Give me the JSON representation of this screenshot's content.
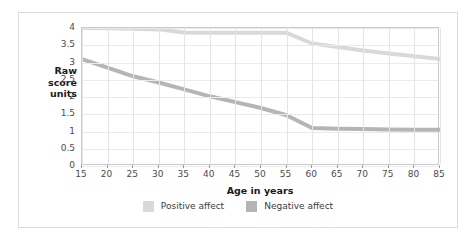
{
  "chart_data": {
    "type": "line",
    "title": "",
    "xlabel": "Age in years",
    "ylabel": "Raw score units",
    "ylabel_lines": [
      "Raw",
      "score",
      "units"
    ],
    "xlim": [
      15,
      85
    ],
    "ylim": [
      0,
      4
    ],
    "grid": true,
    "legend_position": "bottom",
    "x_ticks": [
      "15",
      "20",
      "25",
      "30",
      "35",
      "40",
      "45",
      "50",
      "55",
      "60",
      "65",
      "70",
      "75",
      "80",
      "85"
    ],
    "y_ticks": [
      "0",
      "0.5",
      "1",
      "1.5",
      "2",
      "2.5",
      "3",
      "3.5",
      "4"
    ],
    "x": [
      15,
      20,
      25,
      30,
      35,
      40,
      45,
      50,
      55,
      60,
      65,
      70,
      75,
      80,
      85
    ],
    "series": [
      {
        "name": "Positive affect",
        "color": "#d9d9d9",
        "values": [
          4.0,
          3.99,
          3.98,
          3.96,
          3.87,
          3.86,
          3.86,
          3.86,
          3.86,
          3.55,
          3.45,
          3.35,
          3.26,
          3.18,
          3.1
        ]
      },
      {
        "name": "Negative affect",
        "color": "#b5b5b5",
        "values": [
          3.1,
          2.85,
          2.6,
          2.42,
          2.22,
          2.02,
          1.85,
          1.68,
          1.47,
          1.1,
          1.08,
          1.07,
          1.06,
          1.05,
          1.05
        ]
      }
    ]
  },
  "legend": {
    "items": [
      {
        "label": "Positive affect",
        "color": "#d9d9d9"
      },
      {
        "label": "Negative affect",
        "color": "#b5b5b5"
      }
    ]
  },
  "colors": {
    "positive_affect": "#d9d9d9",
    "negative_affect": "#b5b5b5",
    "frame_border": "#dcdcdc",
    "plot_border": "#c9c9c9",
    "gridline": "#eaeaea",
    "background": "#ffffff",
    "tick_text": "#4c4c4c",
    "axis_title_text": "#1a1a1a"
  }
}
